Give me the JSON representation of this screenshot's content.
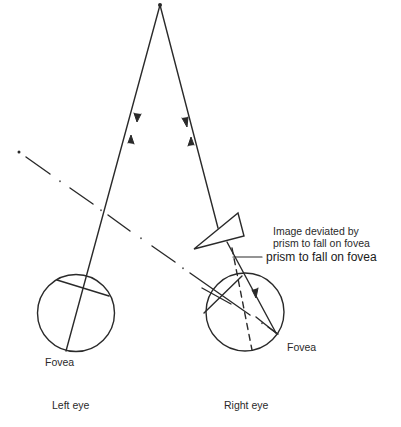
{
  "diagram": {
    "labels": {
      "left_fovea": "Fovea",
      "right_fovea": "Fovea",
      "left_eye": "Left eye",
      "right_eye": "Right eye",
      "annotation_line1": "Image deviated by",
      "annotation_line2": "prism to fall on fovea",
      "annotation_repeat": "prism to fall on fovea"
    },
    "colors": {
      "stroke": "#2a2a2a",
      "background": "#ffffff"
    },
    "elements": [
      "fixation-point",
      "left-eye-circle",
      "right-eye-circle",
      "prism-triangle",
      "visual-axis-left",
      "visual-axis-right",
      "deviated-axis-dashed",
      "dash-dot-reference-line"
    ]
  }
}
